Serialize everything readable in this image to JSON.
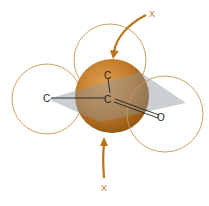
{
  "diagram": {
    "atoms": {
      "top_carbon": "C",
      "center_carbon": "C",
      "left_carbon": "C",
      "oxygen": "O"
    },
    "attack_labels": {
      "top": "X",
      "bottom": "X"
    },
    "colors": {
      "orbital_outline": "#c8955a",
      "sphere": "#c27a28",
      "plane": "#9aa0a6",
      "arrow": "#b87418"
    }
  }
}
